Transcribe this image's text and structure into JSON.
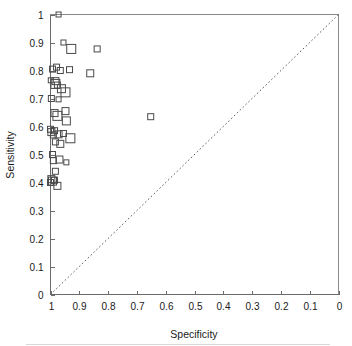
{
  "figure": {
    "background_color": "#ffffff",
    "frame_color": "#8a8a8a",
    "marker_color": "#4a4a4a",
    "diagonal_color": "#5a5a5a"
  },
  "chart_data": {
    "type": "scatter",
    "title": "",
    "subtitle": "",
    "xlabel": "Specificity",
    "ylabel": "Sensitivity",
    "xlim": [
      1,
      0
    ],
    "ylim": [
      0,
      1
    ],
    "x_axis_reversed": true,
    "grid": false,
    "legend": null,
    "legend_position": "none",
    "xticks": [
      1,
      0.9,
      0.8,
      0.7,
      0.6,
      0.5,
      0.4,
      0.3,
      0.2,
      0.1,
      0
    ],
    "xtick_labels": [
      "1",
      "0.9",
      "0.8",
      "0.7",
      "0.6",
      "0.5",
      "0.4",
      "0.3",
      "0.2",
      "0.1",
      "0"
    ],
    "yticks": [
      0,
      0.1,
      0.2,
      0.3,
      0.4,
      0.5,
      0.6,
      0.7,
      0.8,
      0.9,
      1
    ],
    "ytick_labels": [
      "0",
      "0.1",
      "0.2",
      "0.3",
      "0.4",
      "0.5",
      "0.6",
      "0.7",
      "0.8",
      "0.9",
      "1"
    ],
    "marker_shape": "open-square",
    "annotations": [
      {
        "name": "chance-diagonal",
        "type": "line",
        "style": "dotted",
        "from": [
          1,
          0
        ],
        "to": [
          0,
          1
        ],
        "label": ""
      }
    ],
    "series": [
      {
        "name": "studies",
        "marker": "open-square",
        "points": [
          {
            "x": 0.972,
            "y": 1.0,
            "size": 5
          },
          {
            "x": 0.955,
            "y": 0.9,
            "size": 5
          },
          {
            "x": 0.928,
            "y": 0.877,
            "size": 9
          },
          {
            "x": 0.838,
            "y": 0.877,
            "size": 6
          },
          {
            "x": 0.993,
            "y": 0.805,
            "size": 6
          },
          {
            "x": 0.979,
            "y": 0.812,
            "size": 6
          },
          {
            "x": 0.966,
            "y": 0.8,
            "size": 6
          },
          {
            "x": 0.934,
            "y": 0.803,
            "size": 6
          },
          {
            "x": 0.862,
            "y": 0.79,
            "size": 7
          },
          {
            "x": 0.999,
            "y": 0.765,
            "size": 5
          },
          {
            "x": 0.983,
            "y": 0.762,
            "size": 7
          },
          {
            "x": 0.983,
            "y": 0.752,
            "size": 9
          },
          {
            "x": 0.976,
            "y": 0.748,
            "size": 6
          },
          {
            "x": 0.962,
            "y": 0.735,
            "size": 8
          },
          {
            "x": 0.948,
            "y": 0.722,
            "size": 9
          },
          {
            "x": 0.997,
            "y": 0.7,
            "size": 6
          },
          {
            "x": 0.972,
            "y": 0.697,
            "size": 5
          },
          {
            "x": 0.986,
            "y": 0.648,
            "size": 7
          },
          {
            "x": 0.976,
            "y": 0.638,
            "size": 9
          },
          {
            "x": 0.948,
            "y": 0.655,
            "size": 7
          },
          {
            "x": 0.945,
            "y": 0.62,
            "size": 8
          },
          {
            "x": 0.652,
            "y": 0.635,
            "size": 6
          },
          {
            "x": 1.0,
            "y": 0.59,
            "size": 6
          },
          {
            "x": 0.997,
            "y": 0.58,
            "size": 7
          },
          {
            "x": 0.986,
            "y": 0.585,
            "size": 6
          },
          {
            "x": 0.99,
            "y": 0.57,
            "size": 6
          },
          {
            "x": 0.972,
            "y": 0.572,
            "size": 7
          },
          {
            "x": 0.955,
            "y": 0.575,
            "size": 6
          },
          {
            "x": 0.931,
            "y": 0.558,
            "size": 9
          },
          {
            "x": 0.983,
            "y": 0.545,
            "size": 6
          },
          {
            "x": 0.966,
            "y": 0.538,
            "size": 7
          },
          {
            "x": 0.993,
            "y": 0.5,
            "size": 6
          },
          {
            "x": 0.99,
            "y": 0.478,
            "size": 6
          },
          {
            "x": 0.969,
            "y": 0.482,
            "size": 7
          },
          {
            "x": 0.945,
            "y": 0.472,
            "size": 5
          },
          {
            "x": 0.983,
            "y": 0.44,
            "size": 6
          },
          {
            "x": 0.997,
            "y": 0.412,
            "size": 7
          },
          {
            "x": 0.993,
            "y": 0.405,
            "size": 8
          },
          {
            "x": 0.986,
            "y": 0.408,
            "size": 6
          },
          {
            "x": 1.0,
            "y": 0.4,
            "size": 6
          },
          {
            "x": 0.976,
            "y": 0.388,
            "size": 7
          }
        ]
      }
    ]
  }
}
